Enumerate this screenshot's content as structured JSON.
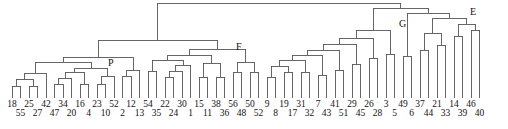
{
  "figure": {
    "kind": "dendrogram",
    "width": 508,
    "height": 129,
    "background": "#ffffff",
    "line_color": "#555555",
    "text_color": "#111111"
  },
  "node_labels": [
    {
      "text": "P",
      "x": 108,
      "y": 58
    },
    {
      "text": "F",
      "x": 236,
      "y": 42
    },
    {
      "text": "G",
      "x": 399,
      "y": 19
    },
    {
      "text": "E",
      "x": 470,
      "y": 7
    }
  ],
  "chart_data": {
    "type": "dendrogram",
    "title": "",
    "xlabel": "",
    "ylabel": "",
    "orientation": "top-down",
    "grid": false,
    "legend": false,
    "leaf_count": 56,
    "leaf_labels": [
      "18",
      "55",
      "25",
      "27",
      "42",
      "47",
      "34",
      "20",
      "16",
      "4",
      "23",
      "10",
      "52",
      "2",
      "12",
      "13",
      "54",
      "35",
      "22",
      "24",
      "30",
      "1",
      "15",
      "11",
      "38",
      "36",
      "56",
      "48",
      "50",
      "52",
      "9",
      "8",
      "19",
      "17",
      "31",
      "32",
      "7",
      "43",
      "41",
      "51",
      "29",
      "45",
      "26",
      "28",
      "3",
      "5",
      "49",
      "6",
      "37",
      "44",
      "21",
      "33",
      "14",
      "39",
      "46",
      "40"
    ],
    "leaf_rows": [
      0,
      1,
      0,
      1,
      0,
      1,
      0,
      1,
      0,
      1,
      0,
      1,
      0,
      1,
      0,
      1,
      0,
      1,
      0,
      1,
      0,
      1,
      0,
      1,
      0,
      1,
      0,
      1,
      0,
      1,
      0,
      1,
      0,
      1,
      0,
      1,
      0,
      1,
      0,
      1,
      0,
      1,
      0,
      1,
      0,
      1,
      0,
      1,
      0,
      1,
      0,
      1,
      0,
      1,
      0,
      1
    ],
    "leaf_x": [
      12,
      20.5,
      29,
      37.5,
      46,
      54.5,
      63,
      71.5,
      80,
      88.5,
      97,
      105.5,
      114,
      122.5,
      131,
      139.5,
      148,
      156.5,
      165,
      173.5,
      182,
      190.5,
      199,
      207.5,
      216,
      224.5,
      233,
      241.5,
      250,
      258.5,
      267,
      275.5,
      284,
      292.5,
      301,
      309.5,
      318,
      326.5,
      335,
      343.5,
      352,
      360.5,
      369,
      377.5,
      386,
      394.5,
      403,
      411.5,
      420,
      428.5,
      437,
      445.5,
      454,
      462.5,
      471,
      479.5
    ],
    "leaf_tick_top": 92,
    "leaf_tick_bottom": 98,
    "label_row_y": [
      99,
      108
    ],
    "merges": [
      {
        "id": "m1",
        "left_x": 12,
        "right_x": 20.5,
        "y": 86,
        "left_y": 92,
        "right_y": 92
      },
      {
        "id": "m2",
        "left_x": 29,
        "right_x": 37.5,
        "y": 86,
        "left_y": 92,
        "right_y": 92
      },
      {
        "id": "m3",
        "left_x": 16.2,
        "right_x": 33.2,
        "y": 79,
        "left_y": 86,
        "right_y": 86
      },
      {
        "id": "m4",
        "left_x": 24.7,
        "right_x": 46,
        "y": 73,
        "left_y": 79,
        "right_y": 92
      },
      {
        "id": "m5",
        "left_x": 54.5,
        "right_x": 63,
        "y": 84,
        "left_y": 92,
        "right_y": 92
      },
      {
        "id": "m6",
        "left_x": 58.7,
        "right_x": 71.5,
        "y": 78,
        "left_y": 84,
        "right_y": 92
      },
      {
        "id": "m7",
        "left_x": 80,
        "right_x": 88.5,
        "y": 84,
        "left_y": 92,
        "right_y": 92
      },
      {
        "id": "m8",
        "left_x": 65.1,
        "right_x": 84.2,
        "y": 72,
        "left_y": 78,
        "right_y": 84
      },
      {
        "id": "m9",
        "left_x": 97,
        "right_x": 105.5,
        "y": 84,
        "left_y": 92,
        "right_y": 92
      },
      {
        "id": "m10",
        "left_x": 101.2,
        "right_x": 114,
        "y": 76,
        "left_y": 84,
        "right_y": 92
      },
      {
        "id": "m11",
        "left_x": 74.6,
        "right_x": 107.6,
        "y": 68,
        "left_y": 72,
        "right_y": 76
      },
      {
        "id": "m12",
        "left_x": 35.3,
        "right_x": 91.1,
        "y": 62,
        "left_y": 73,
        "right_y": 68
      },
      {
        "id": "m13",
        "left_x": 122.5,
        "right_x": 131,
        "y": 76,
        "left_y": 92,
        "right_y": 92
      },
      {
        "id": "m14",
        "left_x": 126.7,
        "right_x": 139.5,
        "y": 70,
        "left_y": 76,
        "right_y": 92
      },
      {
        "id": "m15",
        "left_x": 63.2,
        "right_x": 133.1,
        "y": 57,
        "left_y": 62,
        "right_y": 70
      },
      {
        "id": "m16",
        "left_x": 148,
        "right_x": 156.5,
        "y": 71,
        "left_y": 92,
        "right_y": 92
      },
      {
        "id": "m17",
        "left_x": 165,
        "right_x": 173.5,
        "y": 77,
        "left_y": 92,
        "right_y": 92
      },
      {
        "id": "m18",
        "left_x": 169.2,
        "right_x": 182,
        "y": 71,
        "left_y": 77,
        "right_y": 92
      },
      {
        "id": "m19",
        "left_x": 175.6,
        "right_x": 190.5,
        "y": 65,
        "left_y": 71,
        "right_y": 92
      },
      {
        "id": "m20",
        "left_x": 152.2,
        "right_x": 183.0,
        "y": 60,
        "left_y": 71,
        "right_y": 65
      },
      {
        "id": "m21",
        "left_x": 199,
        "right_x": 207.5,
        "y": 77,
        "left_y": 92,
        "right_y": 92
      },
      {
        "id": "m22",
        "left_x": 216,
        "right_x": 224.5,
        "y": 77,
        "left_y": 92,
        "right_y": 92
      },
      {
        "id": "m23",
        "left_x": 203.2,
        "right_x": 220.2,
        "y": 63,
        "left_y": 77,
        "right_y": 77
      },
      {
        "id": "m24",
        "left_x": 167.6,
        "right_x": 211.7,
        "y": 55,
        "left_y": 60,
        "right_y": 63
      },
      {
        "id": "m25",
        "left_x": 233,
        "right_x": 241.5,
        "y": 72,
        "left_y": 92,
        "right_y": 92
      },
      {
        "id": "m26",
        "left_x": 250,
        "right_x": 258.5,
        "y": 72,
        "left_y": 92,
        "right_y": 92
      },
      {
        "id": "m27",
        "left_x": 237.2,
        "right_x": 254.2,
        "y": 62,
        "left_y": 72,
        "right_y": 72
      },
      {
        "id": "m28",
        "left_x": 189.6,
        "right_x": 245.7,
        "y": 49,
        "left_y": 55,
        "right_y": 62
      },
      {
        "id": "m29",
        "left_x": 98.1,
        "right_x": 217.6,
        "y": 40,
        "left_y": 57,
        "right_y": 49
      },
      {
        "id": "m30",
        "left_x": 267,
        "right_x": 275.5,
        "y": 77,
        "left_y": 92,
        "right_y": 92
      },
      {
        "id": "m31",
        "left_x": 284,
        "right_x": 292.5,
        "y": 72,
        "left_y": 92,
        "right_y": 92
      },
      {
        "id": "m32",
        "left_x": 271.2,
        "right_x": 288.2,
        "y": 66,
        "left_y": 77,
        "right_y": 72
      },
      {
        "id": "m33",
        "left_x": 301,
        "right_x": 309.5,
        "y": 72,
        "left_y": 92,
        "right_y": 92
      },
      {
        "id": "m34",
        "left_x": 279.7,
        "right_x": 305.2,
        "y": 60,
        "left_y": 66,
        "right_y": 72
      },
      {
        "id": "m35",
        "left_x": 318,
        "right_x": 326.5,
        "y": 75,
        "left_y": 92,
        "right_y": 92
      },
      {
        "id": "m36",
        "left_x": 292.4,
        "right_x": 322.2,
        "y": 55,
        "left_y": 60,
        "right_y": 75
      },
      {
        "id": "m37",
        "left_x": 335,
        "right_x": 343.5,
        "y": 70,
        "left_y": 92,
        "right_y": 92
      },
      {
        "id": "m38",
        "left_x": 307.3,
        "right_x": 339.2,
        "y": 50,
        "left_y": 55,
        "right_y": 70
      },
      {
        "id": "m39",
        "left_x": 352,
        "right_x": 360.5,
        "y": 64,
        "left_y": 92,
        "right_y": 92
      },
      {
        "id": "m40",
        "left_x": 323.2,
        "right_x": 356.2,
        "y": 44,
        "left_y": 50,
        "right_y": 64
      },
      {
        "id": "m41",
        "left_x": 369,
        "right_x": 377.5,
        "y": 58,
        "left_y": 92,
        "right_y": 92
      },
      {
        "id": "m42",
        "left_x": 339.7,
        "right_x": 373.2,
        "y": 38,
        "left_y": 44,
        "right_y": 58
      },
      {
        "id": "m43",
        "left_x": 386,
        "right_x": 394.5,
        "y": 54,
        "left_y": 92,
        "right_y": 92
      },
      {
        "id": "m44",
        "left_x": 356.4,
        "right_x": 390.2,
        "y": 30,
        "left_y": 38,
        "right_y": 54
      },
      {
        "id": "m45",
        "left_x": 403,
        "right_x": 411.5,
        "y": 56,
        "left_y": 92,
        "right_y": 92
      },
      {
        "id": "m46",
        "left_x": 420,
        "right_x": 428.5,
        "y": 50,
        "left_y": 92,
        "right_y": 92
      },
      {
        "id": "m47",
        "left_x": 437,
        "right_x": 445.5,
        "y": 45,
        "left_y": 92,
        "right_y": 92
      },
      {
        "id": "m48",
        "left_x": 424.2,
        "right_x": 441.2,
        "y": 33,
        "left_y": 50,
        "right_y": 45
      },
      {
        "id": "m49",
        "left_x": 454,
        "right_x": 462.5,
        "y": 36,
        "left_y": 92,
        "right_y": 92
      },
      {
        "id": "m50",
        "left_x": 471,
        "right_x": 479.5,
        "y": 30,
        "left_y": 92,
        "right_y": 92
      },
      {
        "id": "m51",
        "left_x": 458.2,
        "right_x": 475.2,
        "y": 24,
        "left_y": 36,
        "right_y": 30
      },
      {
        "id": "m52",
        "left_x": 432.7,
        "right_x": 466.7,
        "y": 18,
        "left_y": 33,
        "right_y": 24
      },
      {
        "id": "m53",
        "left_x": 407.2,
        "right_x": 449.7,
        "y": 13,
        "left_y": 56,
        "right_y": 18
      },
      {
        "id": "m54",
        "left_x": 373.3,
        "right_x": 428.4,
        "y": 8,
        "left_y": 30,
        "right_y": 13
      },
      {
        "id": "m55",
        "left_x": 157.8,
        "right_x": 400.8,
        "y": 3,
        "left_y": 40,
        "right_y": 8
      }
    ]
  }
}
